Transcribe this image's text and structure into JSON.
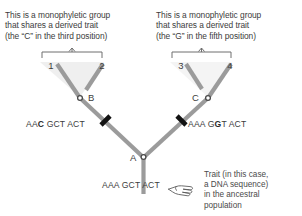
{
  "figure": {
    "type": "phylogenetic-tree-diagram",
    "background": "#ffffff",
    "branch_color": "#9a9a9a",
    "tick_color": "#111111",
    "node_color": "#555555",
    "text_color": "#3c3c3c",
    "shade_color": "#eeeeee"
  },
  "headers": {
    "left": {
      "line1": "This is a monophyletic group",
      "line2": "that shares a derived trait",
      "line3": "(the “C” in the third position)"
    },
    "right": {
      "line1": "This is a monophyletic group",
      "line2": "that shares a derived trait",
      "line3": "(the “G” in the fifth position)"
    }
  },
  "tips": {
    "t1": "1",
    "t2": "2",
    "t3": "3",
    "t4": "4"
  },
  "nodes": {
    "a": "A",
    "b": "B",
    "c": "C"
  },
  "sequences": {
    "left_clade": {
      "full": "AAC GCT ACT",
      "pre": "AA",
      "highlight": "C",
      "post": " GCT ACT"
    },
    "right_clade": {
      "full": "AAA GGT ACT",
      "pre": "AAA G",
      "highlight": "G",
      "post": "T ACT"
    },
    "ancestral": {
      "full": "AAA GCT ACT",
      "pre": "AAA GCT ACT",
      "highlight": "",
      "post": ""
    }
  },
  "caption": {
    "line1": "Trait (in this case,",
    "line2": "a DNA sequence)",
    "line3": "in the ancestral",
    "line4": "population"
  },
  "icons": {
    "pointer": "pointing-hand-left"
  }
}
